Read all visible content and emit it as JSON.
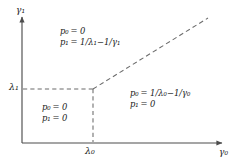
{
  "figure": {
    "type": "phase-diagram",
    "background": "#ffffff",
    "line_color": "#4d4d4d",
    "text_color": "#1a1a1a",
    "axes": {
      "x": {
        "label": "γ",
        "label_sub": "0",
        "arrow": true
      },
      "y": {
        "label": "γ",
        "label_sub": "1",
        "arrow": true
      },
      "origin": {
        "x": 22,
        "y": 143
      }
    },
    "ticks": {
      "x": [
        {
          "label": "λ",
          "label_sub": "0",
          "pos": 93
        }
      ],
      "y": [
        {
          "label": "λ",
          "label_sub": "1",
          "pos": 89
        }
      ]
    },
    "dashed_lines": [
      {
        "name": "horizontal-threshold",
        "from": [
          22,
          89
        ],
        "to": [
          93,
          89
        ]
      },
      {
        "name": "vertical-threshold",
        "from": [
          93,
          89
        ],
        "to": [
          93,
          143
        ]
      },
      {
        "name": "diagonal-boundary",
        "from": [
          93,
          89
        ],
        "to": [
          208,
          18
        ]
      }
    ],
    "regions": [
      {
        "name": "upper-region",
        "lines": [
          {
            "lhs": "p",
            "lhs_sub": "0",
            "rhs": "= 0"
          },
          {
            "lhs": "p",
            "lhs_sub": "1",
            "rhs": "= 1/λ₁−1/γ₁"
          }
        ]
      },
      {
        "name": "lower-left-region",
        "lines": [
          {
            "lhs": "p",
            "lhs_sub": "0",
            "rhs": "= 0"
          },
          {
            "lhs": "p",
            "lhs_sub": "1",
            "rhs": "= 0"
          }
        ]
      },
      {
        "name": "right-region",
        "lines": [
          {
            "lhs": "p",
            "lhs_sub": "0",
            "rhs": "= 1/λ₀−1/γ₀"
          },
          {
            "lhs": "p",
            "lhs_sub": "1",
            "rhs": "= 0"
          }
        ]
      }
    ]
  },
  "labels": {
    "y_axis": "γ₁",
    "x_axis": "γ₀",
    "y_tick": "λ₁",
    "x_tick": "λ₀",
    "upper_p0": "p₀ = 0",
    "upper_p1": "p₁ = 1/λ₁−1/γ₁",
    "lower_p0": "p₀ = 0",
    "lower_p1": "p₁ = 0",
    "right_p0": "p₀ = 1/λ₀−1/γ₀",
    "right_p1": "p₁ = 0"
  }
}
